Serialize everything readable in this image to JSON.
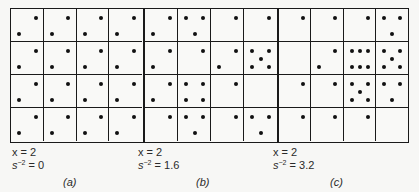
{
  "figure": {
    "grid_rows": 4,
    "grid_cols": 4,
    "dot_positions": {
      "TL": [
        0.25,
        0.27
      ],
      "TR": [
        0.75,
        0.27
      ],
      "BL": [
        0.25,
        0.75
      ],
      "BR": [
        0.75,
        0.75
      ],
      "C": [
        0.5,
        0.5
      ],
      "BC": [
        0.5,
        0.75
      ],
      "TM": [
        0.5,
        0.27
      ],
      "BM": [
        0.5,
        0.75
      ]
    },
    "panels": [
      {
        "id": "a",
        "letter": "(a)",
        "x_label": "x = 2",
        "s_label_base": "s",
        "s_label_exp": "−2",
        "s_label_value": " = 0",
        "left": 10,
        "width": 134,
        "cells": [
          [
            [
              "TR",
              "BL"
            ],
            [
              "TR",
              "BL"
            ],
            [
              "TR",
              "BL"
            ],
            [
              "TR",
              "BL"
            ]
          ],
          [
            [
              "TR",
              "BL"
            ],
            [
              "TR",
              "BL"
            ],
            [
              "TR",
              "BL"
            ],
            [
              "TR",
              "BL"
            ]
          ],
          [
            [
              "TR",
              "BL"
            ],
            [
              "TR",
              "BL"
            ],
            [
              "TR",
              "BL"
            ],
            [
              "TR",
              "BL"
            ]
          ],
          [
            [
              "TR",
              "BL"
            ],
            [
              "TR",
              "BL"
            ],
            [
              "TR",
              "BL"
            ],
            [
              "TR",
              "BL"
            ]
          ]
        ]
      },
      {
        "id": "b",
        "letter": "(b)",
        "x_label": "x = 2",
        "s_label_base": "s",
        "s_label_exp": "−2",
        "s_label_value": " = 1.6",
        "left": 143,
        "width": 135,
        "cells": [
          [
            [
              "TR",
              "BL"
            ],
            [
              "TL",
              "TR",
              "BC"
            ],
            [
              "TR"
            ],
            [
              "TR"
            ]
          ],
          [
            [
              "TR",
              "BL"
            ],
            [
              "TR"
            ],
            [
              "TR",
              "BL"
            ],
            [
              "TL",
              "TR",
              "C",
              "BL",
              "BR"
            ]
          ],
          [
            [
              "TR",
              "BL"
            ],
            [
              "TL",
              "TR",
              "BL",
              "BR"
            ],
            [
              "TR"
            ],
            []
          ],
          [
            [
              "TR"
            ],
            [
              "TL",
              "TR",
              "BC"
            ],
            [
              "TR"
            ],
            [
              "TL",
              "TR",
              "BC"
            ]
          ]
        ]
      },
      {
        "id": "c",
        "letter": "(c)",
        "x_label": "x = 2",
        "s_label_base": "s",
        "s_label_exp": "−2",
        "s_label_value": " = 3.2",
        "left": 277,
        "width": 132,
        "cells": [
          [
            [
              "TR"
            ],
            [
              "TR"
            ],
            [
              "TR"
            ],
            [
              "TL",
              "TR",
              "BC"
            ]
          ],
          [
            [],
            [
              "TR",
              "BL"
            ],
            [
              "TL",
              "TM",
              "TR",
              "BL",
              "BM",
              "BR"
            ],
            [
              "TL",
              "TR",
              "C",
              "BL",
              "BR"
            ]
          ],
          [
            [
              "TR"
            ],
            [
              "TR"
            ],
            [
              "TL",
              "TR",
              "C",
              "BL",
              "BR"
            ],
            [
              "TL",
              "TR",
              "BC"
            ]
          ],
          [
            [
              "TR"
            ],
            [
              "TR"
            ],
            [
              "TR"
            ],
            []
          ]
        ]
      }
    ]
  }
}
